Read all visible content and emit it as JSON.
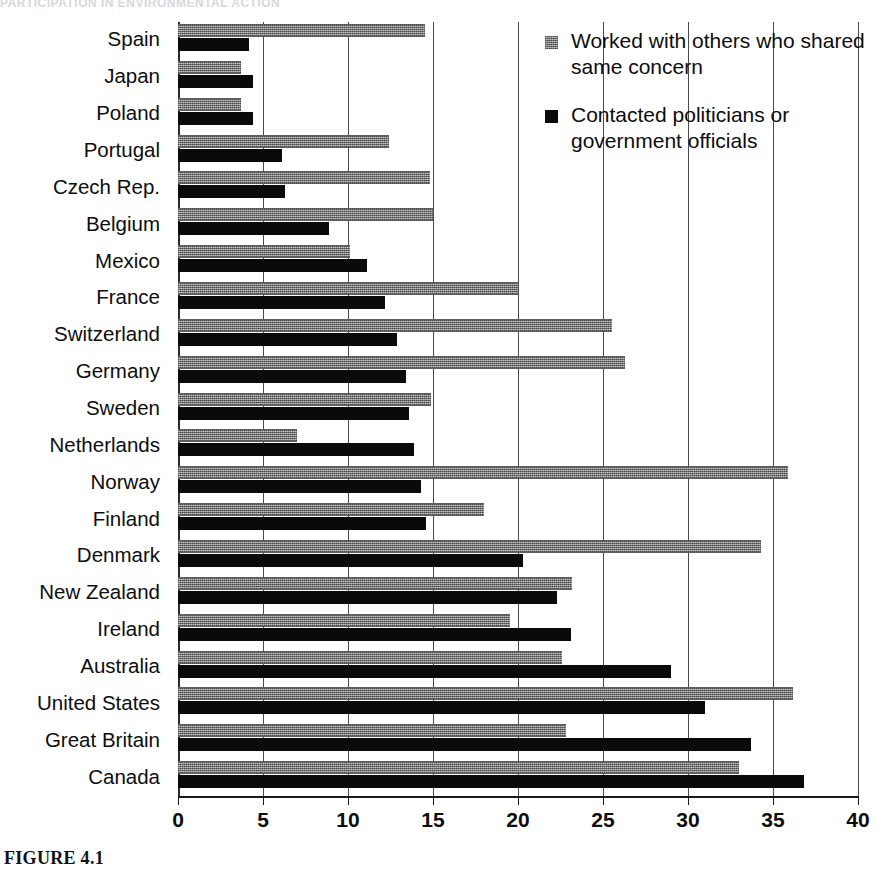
{
  "figure": {
    "caption": "FIGURE 4.1",
    "cropped_title": "PARTICIPATION IN ENVIRONMENTAL ACTION"
  },
  "legend": {
    "position": "top-right",
    "entries": [
      {
        "label": "Worked with others who shared same concern",
        "swatch": "gray-swatch-icon",
        "color": "#8a8a8a"
      },
      {
        "label": "Contacted politicians or government officials",
        "swatch": "black-swatch-icon",
        "color": "#0a0a0a"
      }
    ]
  },
  "axis": {
    "x_ticks": [
      "0",
      "5",
      "10",
      "15",
      "20",
      "25",
      "30",
      "35",
      "40"
    ]
  },
  "chart_data": {
    "type": "bar",
    "orientation": "horizontal",
    "title": "",
    "xlabel": "",
    "ylabel": "",
    "xlim": [
      0,
      40
    ],
    "grid": true,
    "legend_position": "top-right",
    "categories": [
      "Spain",
      "Japan",
      "Poland",
      "Portugal",
      "Czech Rep.",
      "Belgium",
      "Mexico",
      "France",
      "Switzerland",
      "Germany",
      "Sweden",
      "Netherlands",
      "Norway",
      "Finland",
      "Denmark",
      "New Zealand",
      "Ireland",
      "Australia",
      "United States",
      "Great Britain",
      "Canada"
    ],
    "series": [
      {
        "name": "Worked with others who shared same concern",
        "color": "#8a8a8a",
        "values": [
          14.5,
          3.7,
          3.7,
          12.4,
          14.8,
          15.0,
          10.1,
          20.0,
          25.5,
          26.3,
          14.9,
          7.0,
          35.9,
          18.0,
          34.3,
          23.2,
          19.5,
          22.6,
          36.2,
          22.8,
          33.0
        ]
      },
      {
        "name": "Contacted politicians or government officials",
        "color": "#0a0a0a",
        "values": [
          4.2,
          4.4,
          4.4,
          6.1,
          6.3,
          8.9,
          11.1,
          12.2,
          12.9,
          13.4,
          13.6,
          13.9,
          14.3,
          14.6,
          20.3,
          22.3,
          23.1,
          29.0,
          31.0,
          33.7,
          36.8
        ]
      }
    ]
  }
}
